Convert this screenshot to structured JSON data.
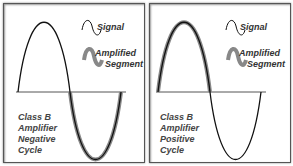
{
  "panels": [
    {
      "id": "negative",
      "legend": {
        "signal": "Signal",
        "amplified_line1": "Amplified",
        "amplified_line2": "Segment"
      },
      "caption": [
        "Class B",
        "Amplifier",
        "Negative",
        "Cycle"
      ],
      "amplified_half": "negative"
    },
    {
      "id": "positive",
      "legend": {
        "signal": "Signal",
        "amplified_line1": "Amplified",
        "amplified_line2": "Segment"
      },
      "caption": [
        "Class B",
        "Amplifier",
        "Positive",
        "Cycle"
      ],
      "amplified_half": "positive"
    }
  ],
  "colors": {
    "signal": "#111111",
    "amplified": "#888888",
    "axis": "#555555",
    "border": "#555555"
  }
}
